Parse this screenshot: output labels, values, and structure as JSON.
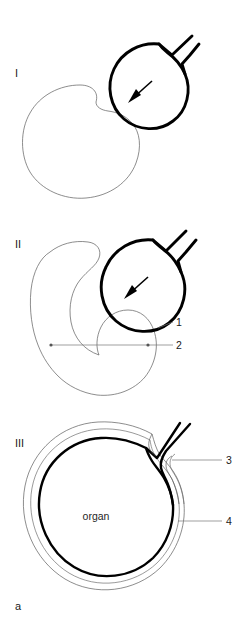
{
  "figure": {
    "letter": "a",
    "panels": [
      {
        "id": "panel-1",
        "label": "I",
        "arrow_icon": "down-left-arrow"
      },
      {
        "id": "panel-2",
        "label": "II",
        "arrow_icon": "down-left-arrow",
        "callouts": [
          {
            "number": "1"
          },
          {
            "number": "2"
          }
        ]
      },
      {
        "id": "panel-3",
        "label": "III",
        "inner_text": "organ",
        "callouts": [
          {
            "number": "3"
          },
          {
            "number": "4"
          }
        ]
      }
    ],
    "colors": {
      "bold_line": "#000000",
      "thin_line": "#5b5b5b",
      "leader_line": "#777777",
      "text": "#1a1a1a",
      "background": "#ffffff"
    }
  }
}
